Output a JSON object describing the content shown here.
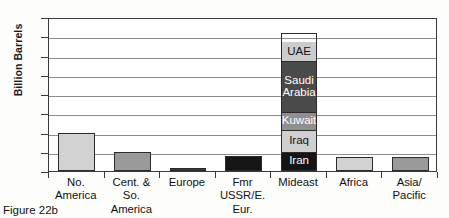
{
  "figure": {
    "caption": "Figure 22b"
  },
  "chart_data": {
    "type": "bar",
    "title": "",
    "xlabel": "",
    "ylabel": "Billion Barrels",
    "ylim": [
      0,
      800
    ],
    "yticks": [
      0,
      100,
      200,
      300,
      400,
      500,
      600,
      700,
      800
    ],
    "ytick_labels": [
      "0",
      "100",
      "200",
      "300",
      "400",
      "500",
      "600",
      "700",
      "800"
    ],
    "grid": true,
    "legend": "none",
    "categories": [
      "No.\nAmerica",
      "Cent. & So.\nAmerica",
      "Europe",
      "Fmr\nUSSR/E.\nEur.",
      "Mideast",
      "Africa",
      "Asia/\nPacific"
    ],
    "values": [
      200,
      100,
      18,
      78,
      715,
      75,
      75
    ],
    "bar_colors": [
      "#d2d2d2",
      "#9a9a9a",
      "#3a3a3a",
      "#161616",
      "stacked",
      "#d2d2d2",
      "#9a9a9a"
    ],
    "stacked_bar": {
      "category": "Mideast",
      "total": 715,
      "segments": [
        {
          "label": "Iran",
          "value": 90,
          "color": "#141414",
          "text_color": "#ffffff"
        },
        {
          "label": "Iraq",
          "value": 113,
          "color": "#d0d0d0",
          "text_color": "#111111"
        },
        {
          "label": "Kuwait",
          "value": 95,
          "color": "#8f8f8f",
          "text_color": "#ffffff"
        },
        {
          "label": "Saudi\nArabia",
          "value": 265,
          "color": "#4a4a4a",
          "text_color": "#ffffff"
        },
        {
          "label": "UAE",
          "value": 100,
          "color": "#cccccc",
          "text_color": "#111111"
        }
      ]
    }
  }
}
